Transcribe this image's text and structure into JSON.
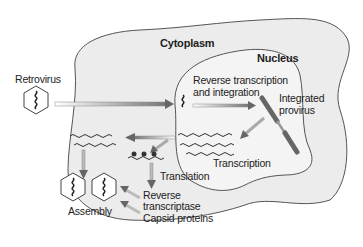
{
  "diagram": {
    "regions": {
      "cytoplasm": "Cytoplasm",
      "nucleus": "Nucleus"
    },
    "labels": {
      "retrovirus": "Retrovirus",
      "reverse_transcription_line1": "Reverse transcription",
      "reverse_transcription_line2": "and integration",
      "integrated_provirus_line1": "Integrated",
      "integrated_provirus_line2": "provirus",
      "transcription": "Transcription",
      "translation": "Translation",
      "assembly": "Assembly",
      "reverse_transcriptase_line1": "Reverse",
      "reverse_transcriptase_line2": "transcriptase",
      "capsid_proteins": "Capsid proteins"
    },
    "colors": {
      "cytoplasm_fill": "#ececec",
      "nucleus_fill": "#f4f4f4",
      "outline": "#555555",
      "provirus": "#8a8a8a",
      "arrow": "#9a9a9a"
    }
  }
}
